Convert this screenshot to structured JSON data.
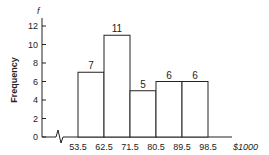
{
  "chart_data": {
    "type": "bar",
    "title": "",
    "xlabel": "$1000",
    "ylabel": "Frequency",
    "y_axis_symbol": "f",
    "bin_edges": [
      53.5,
      62.5,
      71.5,
      80.5,
      89.5,
      98.5
    ],
    "categories": [
      "53.5-62.5",
      "62.5-71.5",
      "71.5-80.5",
      "80.5-89.5",
      "89.5-98.5"
    ],
    "values": [
      7,
      11,
      5,
      6,
      6
    ],
    "ylim": [
      0,
      12
    ],
    "yticks": [
      0,
      2,
      4,
      6,
      8,
      10,
      12
    ],
    "xticks": [
      "53.5",
      "62.5",
      "71.5",
      "80.5",
      "89.5",
      "98.5"
    ],
    "axis_break": true,
    "grid": false,
    "legend": null,
    "bar_fill": "#ffffff",
    "bar_stroke": "#222222"
  }
}
